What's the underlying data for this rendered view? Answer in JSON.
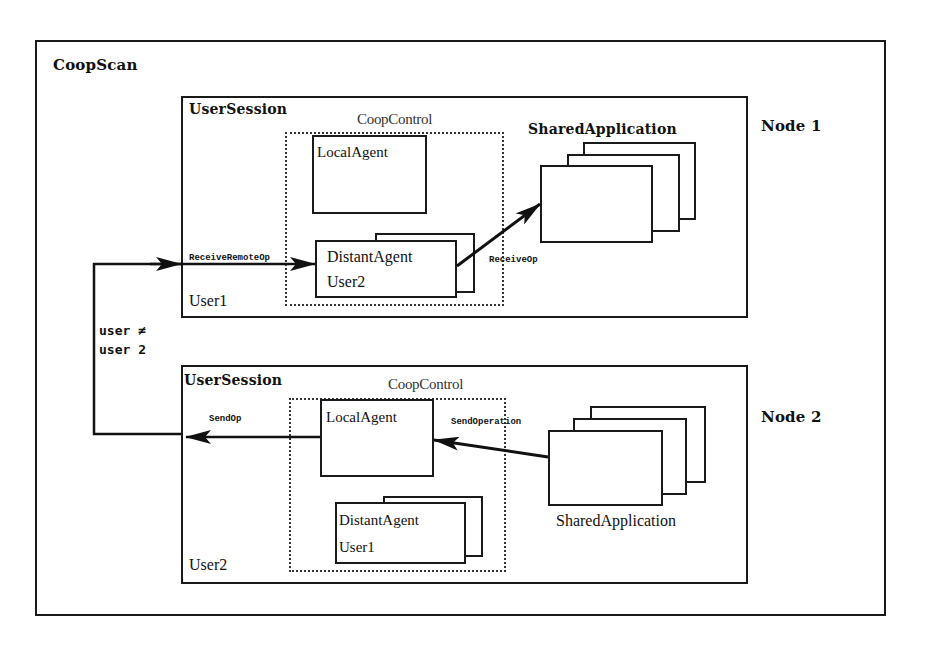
{
  "diagram": {
    "title": "CoopScan",
    "nodes": [
      {
        "label": "Node 1",
        "session": {
          "label": "UserSession",
          "user": "User1",
          "coop_control": {
            "label": "CoopControl",
            "local_agent": "LocalAgent",
            "distant_agent": {
              "label": "DistantAgent",
              "user": "User2"
            }
          },
          "shared_application": "SharedApplication",
          "edges": {
            "incoming": "ReceiveRemoteOp",
            "to_application": "ReceiveOp"
          }
        }
      },
      {
        "label": "Node 2",
        "session": {
          "label": "UserSession",
          "user": "User2",
          "coop_control": {
            "label": "CoopControl",
            "local_agent": "LocalAgent",
            "distant_agent": {
              "label": "DistantAgent",
              "user": "User1"
            }
          },
          "shared_application": "SharedApplication",
          "edges": {
            "outgoing": "SendOp",
            "from_application": "SendOperation"
          }
        }
      }
    ],
    "condition": {
      "line1": "user ≠",
      "line2": "user 2"
    }
  }
}
